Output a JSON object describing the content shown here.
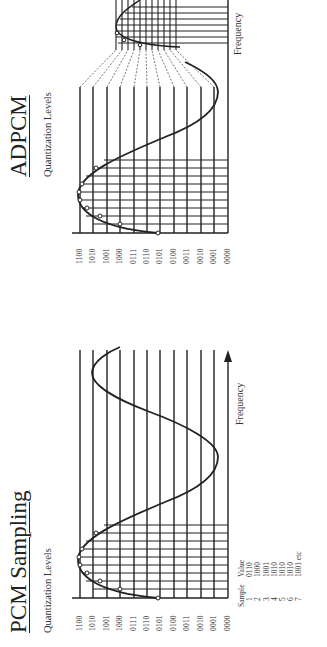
{
  "pcm": {
    "title": "PCM Sampling",
    "subtitle": "Quantization Levels",
    "levels": [
      "1100",
      "1010",
      "1001",
      "1000",
      "0111",
      "0110",
      "0101",
      "0100",
      "0011",
      "0010",
      "0001",
      "0000"
    ],
    "x_axis_label": "Frequency",
    "table": {
      "headers": [
        "Sample",
        "Value"
      ],
      "rows": [
        [
          "1",
          "0110"
        ],
        [
          "2",
          "1000"
        ],
        [
          "3",
          "1001"
        ],
        [
          "4",
          "1010"
        ],
        [
          "5",
          "1010"
        ],
        [
          "6",
          "1010"
        ],
        [
          "7",
          "1001 etc"
        ]
      ]
    }
  },
  "adpcm": {
    "title": "ADPCM",
    "subtitle": "Quantization Levels",
    "levels": [
      "1100",
      "1010",
      "1001",
      "1000",
      "0111",
      "0110",
      "0101",
      "0100",
      "0011",
      "0010",
      "0001",
      "0000"
    ],
    "x_axis_label": "Frequency"
  },
  "colors": {
    "line": "#222222",
    "background": "#ffffff",
    "dashed": "#555555"
  }
}
